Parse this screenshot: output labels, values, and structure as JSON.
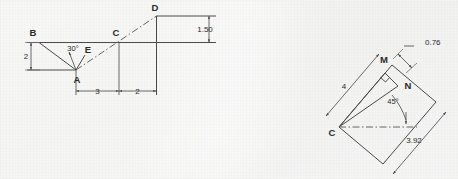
{
  "figure": {
    "background_color": "#ededeb",
    "line_color": "#4a4a4a",
    "text_color": "#2a2a2a"
  },
  "left_diagram": {
    "name": "truss-linkage-elevation",
    "points": [
      {
        "id": "B",
        "label": "B"
      },
      {
        "id": "C",
        "label": "C"
      },
      {
        "id": "D",
        "label": "D"
      },
      {
        "id": "A",
        "label": "A"
      },
      {
        "id": "E",
        "label": "E"
      }
    ],
    "dimensions": [
      {
        "id": "vertical-2",
        "label": "2",
        "orientation": "vertical"
      },
      {
        "id": "horizontal-3",
        "label": "3",
        "orientation": "horizontal"
      },
      {
        "id": "horizontal-2",
        "label": "2",
        "orientation": "horizontal"
      },
      {
        "id": "vertical-150",
        "label": "1.50",
        "orientation": "vertical"
      }
    ],
    "angles": [
      {
        "id": "angle-30",
        "label": "30°"
      }
    ]
  },
  "right_diagram": {
    "name": "rotated-rectangle-detail",
    "points": [
      {
        "id": "C",
        "label": "C"
      },
      {
        "id": "M",
        "label": "M"
      },
      {
        "id": "N",
        "label": "N"
      }
    ],
    "dimensions": [
      {
        "id": "edge-4",
        "label": "4"
      },
      {
        "id": "offset-076",
        "label": "0.76"
      },
      {
        "id": "edge-392",
        "label": "3.92"
      }
    ],
    "angles": [
      {
        "id": "angle-45",
        "label": "45°"
      }
    ],
    "marks": [
      {
        "id": "right-angle-mark",
        "label": "perpendicular"
      }
    ]
  }
}
